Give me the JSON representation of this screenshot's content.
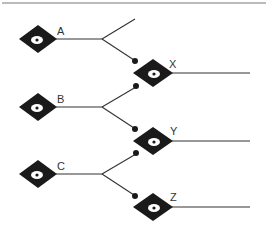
{
  "diagram": {
    "type": "network",
    "colors": {
      "node": "#1a1a1a",
      "line": "#333333",
      "eye": "#ffffff",
      "top_rule": "#777777"
    },
    "inputs": [
      {
        "id": "A",
        "label": "A"
      },
      {
        "id": "B",
        "label": "B"
      },
      {
        "id": "C",
        "label": "C"
      }
    ],
    "outputs": [
      {
        "id": "X",
        "label": "X"
      },
      {
        "id": "Y",
        "label": "Y"
      },
      {
        "id": "Z",
        "label": "Z"
      }
    ],
    "edges": [
      {
        "from": "A",
        "to": "X"
      },
      {
        "from": "B",
        "to": "X"
      },
      {
        "from": "B",
        "to": "Y"
      },
      {
        "from": "C",
        "to": "Y"
      },
      {
        "from": "C",
        "to": "Z"
      }
    ],
    "dangling_edges": [
      {
        "from": "A",
        "direction": "up"
      }
    ]
  }
}
